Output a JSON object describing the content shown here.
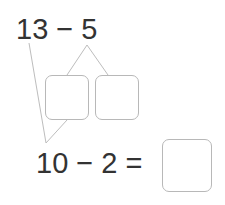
{
  "problem": {
    "top_expression": "13 − 5",
    "bottom_expression": "10 − 2 =",
    "split_boxes": [
      {
        "value": ""
      },
      {
        "value": ""
      }
    ],
    "answer_box": {
      "value": ""
    }
  },
  "colors": {
    "text": "#333333",
    "box_border": "#b8b8b8",
    "connector_line": "#bdbdbd",
    "background": "#ffffff"
  }
}
